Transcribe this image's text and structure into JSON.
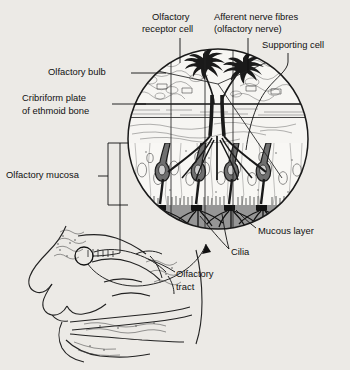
{
  "figure": {
    "background_color": "#eceae6",
    "ink_color": "#111111",
    "mucous_layer_color": "#8f8f8f"
  },
  "labels": {
    "olfactory_receptor_cell": "Olfactory\nreceptor cell",
    "olfactory_receptor_cell_line1": "Olfactory",
    "olfactory_receptor_cell_line2": "receptor cell",
    "afferent_nerve_fibres_line1": "Afferent nerve fibres",
    "afferent_nerve_fibres_line2": "(olfactory nerve)",
    "supporting_cell": "Supporting cell",
    "olfactory_bulb": "Olfactory bulb",
    "cribriform_plate_line1": "Cribriform plate",
    "cribriform_plate_line2": "of ethmoid bone",
    "olfactory_mucosa": "Olfactory mucosa",
    "mucous_layer": "Mucous layer",
    "cilia": "Cilia",
    "olfactory_tract_line1": "Olfactory",
    "olfactory_tract_line2": "tract"
  },
  "regions": {
    "magnifier_circle": {
      "center_x": 218,
      "center_y": 139,
      "radius": 90
    },
    "callout_circle": {
      "center_x": 84,
      "center_y": 256,
      "radius": 9
    },
    "layers": [
      {
        "name": "olfactory-bulb",
        "top": 48,
        "bottom": 104
      },
      {
        "name": "cribriform-plate",
        "top": 104,
        "bottom": 118
      },
      {
        "name": "submucosa",
        "top": 118,
        "bottom": 143
      },
      {
        "name": "olfactory-mucosa",
        "top": 143,
        "bottom": 205
      },
      {
        "name": "mucous-layer",
        "top": 205,
        "bottom": 229
      }
    ]
  }
}
